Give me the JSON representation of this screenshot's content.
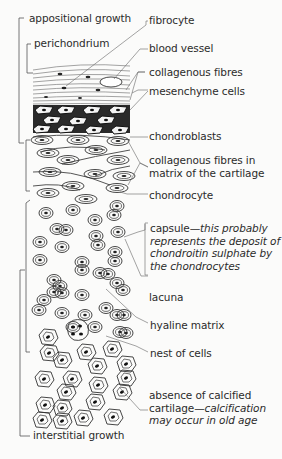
{
  "figure": {
    "background": "#fbfbfa",
    "ink": "#2b2b2b"
  },
  "left_labels": {
    "appositional_growth": "appositional growth",
    "perichondrium": "perichondrium",
    "interstitial_growth": "interstitial growth"
  },
  "right_labels": {
    "fibrocyte": "fibrocyte",
    "blood_vessel": "blood vessel",
    "collagenous_fibres": "collagenous fibres",
    "mesenchyme_cells": "mesenchyme cells",
    "chondroblasts": "chondroblasts",
    "collagenous_fibres_matrix_line1": "collagenous fibres in",
    "collagenous_fibres_matrix_line2": "matrix of the cartilage",
    "chondrocyte": "chondrocyte",
    "capsule_prefix": "capsule—",
    "capsule_line1_italic": "this probably",
    "capsule_line2": "represents the deposit of",
    "capsule_line3": "chondroitin sulphate by",
    "capsule_line4": "the chondrocytes",
    "lacuna": "lacuna",
    "hyaline_matrix": "hyaline matrix",
    "nest_of_cells": "nest of cells",
    "absence_line1": "absence of calcified",
    "absence_line2_prefix": "cartilage—",
    "absence_line2_italic": "calcification",
    "absence_line3_italic": "may occur in old age"
  }
}
